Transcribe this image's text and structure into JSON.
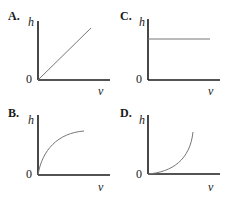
{
  "top_fragment": "...",
  "panels": [
    {
      "label": "A.",
      "y_axis": "h",
      "x_axis": "v",
      "origin": "0",
      "curve": "linear"
    },
    {
      "label": "B.",
      "y_axis": "h",
      "x_axis": "v",
      "origin": "0",
      "curve": "concave-down"
    },
    {
      "label": "C.",
      "y_axis": "h",
      "x_axis": "v",
      "origin": "0",
      "curve": "constant"
    },
    {
      "label": "D.",
      "y_axis": "h",
      "x_axis": "v",
      "origin": "0",
      "curve": "concave-up"
    }
  ],
  "colors": {
    "axis": "#1a1a1a",
    "curve": "#777777"
  }
}
